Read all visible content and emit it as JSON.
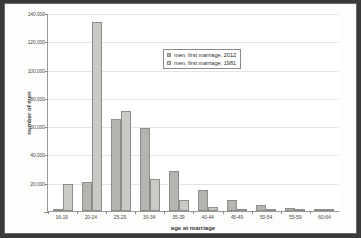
{
  "chart_data": {
    "type": "bar",
    "title": "",
    "xlabel": "age at marriage",
    "ylabel": "number of men",
    "categories": [
      "16-19",
      "20-24",
      "25-29",
      "30-34",
      "35-39",
      "40-44",
      "45-49",
      "50-54",
      "55-59",
      "60-64"
    ],
    "series": [
      {
        "name": "men, first marriage, 2012",
        "color": "#b4b4b0",
        "values": [
          600,
          20500,
          65000,
          59000,
          28000,
          15000,
          8000,
          4000,
          1800,
          1300
        ]
      },
      {
        "name": "men, first marriage, 1981",
        "color": "#c9c9c5",
        "values": [
          19000,
          134000,
          70500,
          22500,
          8000,
          2500,
          1200,
          700,
          400,
          300
        ]
      }
    ],
    "ylim": [
      0,
      140000
    ],
    "yticks": [
      0,
      20000,
      40000,
      60000,
      80000,
      100000,
      120000,
      140000
    ],
    "ytick_labels": [
      "-",
      "20,000",
      "40,000",
      "60,000",
      "80,000",
      "100,000",
      "120,000",
      "140,000"
    ],
    "grid": true,
    "legend_position": "upper-center"
  },
  "legend": {
    "entries": [
      {
        "label": "men, first marriage, 2012"
      },
      {
        "label": "men, first marriage, 1981"
      }
    ]
  }
}
